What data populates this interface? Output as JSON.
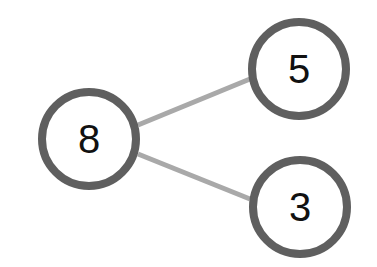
{
  "diagram": {
    "type": "number-bond",
    "colors": {
      "node_stroke": "#5f5f5f",
      "node_fill": "#ffffff",
      "edge": "#a9a9a9",
      "text": "#111111"
    },
    "nodes": [
      {
        "id": "whole",
        "label": "8",
        "cx": 89,
        "cy": 139,
        "r": 47
      },
      {
        "id": "part-top",
        "label": "5",
        "cx": 299,
        "cy": 69,
        "r": 47
      },
      {
        "id": "part-bottom",
        "label": "3",
        "cx": 300,
        "cy": 207,
        "r": 47
      }
    ],
    "edges": [
      {
        "from": "whole",
        "to": "part-top"
      },
      {
        "from": "whole",
        "to": "part-bottom"
      }
    ]
  }
}
